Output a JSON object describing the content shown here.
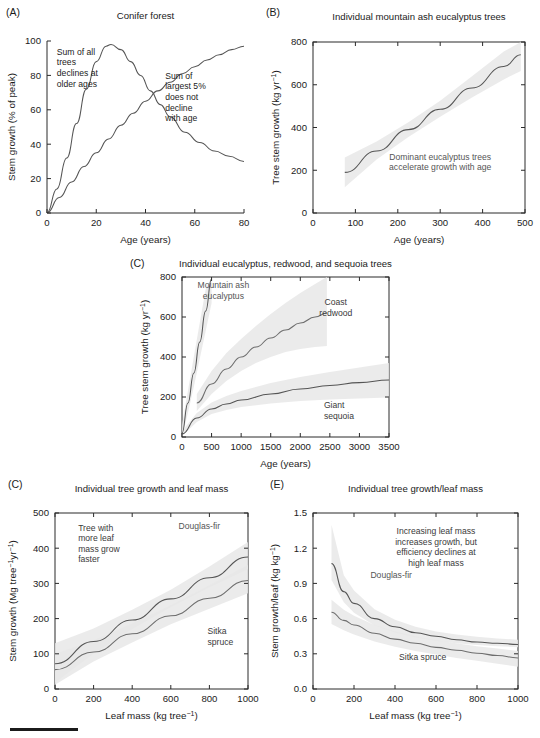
{
  "figure": {
    "caption_rule": true,
    "background": "#ffffff",
    "curve_color_dark": "#555555",
    "curve_color_mid": "#6e6e6e",
    "band_color": "#e8e8e8"
  },
  "panels": [
    {
      "id": "A",
      "label": "(A)",
      "title": "Conifer forest",
      "xlabel": "Age (years)",
      "ylabel": "Stem growth (% of peak)",
      "annotations": [
        "Sum of all trees declines at older ages",
        "Sum of largest 5% does not decline with age"
      ],
      "chart_data": {
        "type": "line",
        "title": "Conifer forest",
        "xlabel": "Age (years)",
        "ylabel": "Stem growth (% of peak)",
        "xlim": [
          0,
          80
        ],
        "ylim": [
          0,
          100
        ],
        "xticks": [
          0,
          20,
          40,
          60,
          80
        ],
        "yticks": [
          0,
          20,
          40,
          60,
          80,
          100
        ],
        "grid": false,
        "legend": "none",
        "series": [
          {
            "name": "Sum of all trees",
            "x": [
              0,
              4,
              8,
              12,
              16,
              20,
              24,
              26,
              30,
              34,
              38,
              42,
              46,
              50,
              56,
              62,
              68,
              74,
              80
            ],
            "y": [
              0,
              14,
              32,
              52,
              72,
              88,
              97,
              98,
              95,
              88,
              80,
              71,
              63,
              56,
              47,
              41,
              36,
              33,
              30
            ]
          },
          {
            "name": "Sum of largest 5%",
            "x": [
              0,
              5,
              10,
              15,
              20,
              25,
              30,
              35,
              40,
              45,
              50,
              55,
              60,
              65,
              70,
              75,
              80
            ],
            "y": [
              0,
              9,
              18,
              27,
              35,
              43,
              51,
              58,
              65,
              71,
              76,
              81,
              85,
              89,
              92,
              95,
              97
            ]
          }
        ],
        "annotations": [
          {
            "text": "Sum of all trees declines at older ages",
            "x": 4,
            "y": 92
          },
          {
            "text": "Sum of largest 5% does not decline with age",
            "x": 48,
            "y": 78
          }
        ]
      }
    },
    {
      "id": "B",
      "label": "(B)",
      "title": "Individual mountain ash eucalyptus trees",
      "xlabel": "Age (years)",
      "ylabel": "Tree stem growth (kg yr⁻¹)",
      "annotations": [
        "Dominant eucalyptus trees accelerate growth with age"
      ],
      "chart_data": {
        "type": "line",
        "title": "Individual mountain ash eucalyptus trees",
        "xlabel": "Age (years)",
        "ylabel": "Tree stem growth (kg yr-1)",
        "xlim": [
          0,
          500
        ],
        "ylim": [
          0,
          800
        ],
        "xticks": [
          0,
          100,
          200,
          300,
          400,
          500
        ],
        "yticks": [
          0,
          200,
          400,
          600,
          800
        ],
        "grid": false,
        "legend": "none",
        "series": [
          {
            "name": "Mountain ash eucalyptus",
            "x": [
              75,
              150,
              225,
              300,
              375,
              450,
              490
            ],
            "y": [
              190,
              290,
              390,
              485,
              585,
              685,
              740
            ],
            "band_lower": [
              120,
              250,
              355,
              450,
              540,
              625,
              665
            ],
            "band_upper": [
              260,
              335,
              425,
              525,
              640,
              755,
              800
            ]
          }
        ],
        "annotations": [
          {
            "text": "Dominant eucalyptus trees accelerate growth with age",
            "x": 300,
            "y": 250
          }
        ]
      }
    },
    {
      "id": "C",
      "label": "(C)",
      "title": "Individual eucalyptus, redwood, and sequoia trees",
      "xlabel": "Age (years)",
      "ylabel": "Tree stem growth (kg yr⁻¹)",
      "annotations": [
        "Mountain ash eucalyptus",
        "Coast redwood",
        "Giant sequoia"
      ],
      "chart_data": {
        "type": "line",
        "title": "Individual eucalyptus, redwood, and sequoia trees",
        "xlabel": "Age (years)",
        "ylabel": "Tree stem growth (kg yr-1)",
        "xlim": [
          0,
          3500
        ],
        "ylim": [
          0,
          800
        ],
        "xticks": [
          0,
          500,
          1000,
          1500,
          2000,
          2500,
          3000,
          3500
        ],
        "yticks": [
          0,
          200,
          400,
          600,
          800
        ],
        "grid": false,
        "legend": "none",
        "series": [
          {
            "name": "Mountain ash eucalyptus",
            "x": [
              0,
              100,
              200,
              300,
              400,
              500
            ],
            "y": [
              20,
              170,
              320,
              475,
              630,
              790
            ],
            "band_lower": [
              0,
              120,
              250,
              390,
              530,
              670
            ],
            "band_upper": [
              60,
              230,
              400,
              570,
              740,
              800
            ]
          },
          {
            "name": "Coast redwood",
            "x": [
              250,
              500,
              750,
              1000,
              1250,
              1500,
              1750,
              2000,
              2250,
              2450
            ],
            "y": [
              170,
              265,
              340,
              400,
              450,
              495,
              535,
              570,
              600,
              620
            ],
            "band_lower": [
              130,
              215,
              280,
              330,
              370,
              400,
              425,
              440,
              450,
              455
            ],
            "band_upper": [
              215,
              330,
              420,
              490,
              555,
              615,
              670,
              720,
              765,
              800
            ]
          },
          {
            "name": "Giant sequoia",
            "x": [
              0,
              250,
              500,
              750,
              1000,
              1500,
              2000,
              2500,
              3000,
              3500
            ],
            "y": [
              15,
              95,
              140,
              165,
              185,
              215,
              240,
              258,
              272,
              285
            ],
            "band_lower": [
              5,
              75,
              115,
              135,
              150,
              168,
              180,
              188,
              193,
              197
            ],
            "band_upper": [
              30,
              120,
              172,
              205,
              230,
              270,
              300,
              325,
              348,
              370
            ]
          }
        ],
        "annotations": [
          {
            "text": "Mountain ash eucalyptus",
            "x": 700,
            "y": 745
          },
          {
            "text": "Coast redwood",
            "x": 2600,
            "y": 660
          },
          {
            "text": "Giant sequoia",
            "x": 2400,
            "y": 145
          }
        ]
      }
    },
    {
      "id": "D",
      "label": "(C)",
      "title": "Individual tree growth and leaf mass",
      "xlabel": "Leaf mass (kg tree⁻¹)",
      "ylabel": "Stem growth (Mg tree⁻¹ yr⁻¹)",
      "annotations": [
        "Tree with more leaf mass grow faster",
        "Douglas-fir",
        "Sitka spruce"
      ],
      "chart_data": {
        "type": "line",
        "title": "Individual tree growth and leaf mass",
        "xlabel": "Leaf mass (kg tree-1)",
        "ylabel": "Stem growth (Mg tree-1 yr-1)",
        "xlim": [
          0,
          1000
        ],
        "ylim": [
          0,
          500
        ],
        "xticks": [
          0,
          200,
          400,
          600,
          800,
          1000
        ],
        "yticks": [
          0,
          100,
          200,
          300,
          400,
          500
        ],
        "grid": false,
        "legend": "none",
        "series": [
          {
            "name": "Douglas-fir",
            "x": [
              0,
              200,
              400,
              600,
              800,
              1000
            ],
            "y": [
              72,
              135,
              196,
              256,
              316,
              375
            ],
            "band_lower": [
              18,
              100,
              170,
              232,
              288,
              340
            ],
            "band_upper": [
              130,
              172,
              225,
              282,
              348,
              418
            ]
          },
          {
            "name": "Sitka spruce",
            "x": [
              0,
              200,
              400,
              600,
              800,
              1000
            ],
            "y": [
              55,
              105,
              157,
              208,
              258,
              308
            ],
            "band_lower": [
              12,
              78,
              132,
              184,
              228,
              272
            ],
            "band_upper": [
              100,
              138,
              186,
              238,
              295,
              352
            ]
          }
        ],
        "annotations": [
          {
            "text": "Tree with more leaf mass grow faster",
            "x": 120,
            "y": 450
          },
          {
            "text": "Douglas-fir",
            "x": 640,
            "y": 455
          },
          {
            "text": "Sitka spruce",
            "x": 790,
            "y": 155
          }
        ]
      }
    },
    {
      "id": "E",
      "label": "(E)",
      "title": "Individual tree growth/leaf mass",
      "xlabel": "Leaf mass (kg tree⁻¹)",
      "ylabel": "Stem growth/leaf (kg kg⁻¹)",
      "annotations": [
        "Increasing leaf mass increases growth, but efficiency declines at high leaf mass",
        "Douglas-fir",
        "Sitka spruce"
      ],
      "chart_data": {
        "type": "line",
        "title": "Individual tree growth/leaf mass",
        "xlabel": "Leaf mass (kg tree-1)",
        "ylabel": "Stem growth/leaf (kg kg-1)",
        "xlim": [
          0,
          1000
        ],
        "ylim": [
          0.0,
          1.5
        ],
        "xticks": [
          0,
          200,
          400,
          600,
          800,
          1000
        ],
        "yticks": [
          0.0,
          0.3,
          0.6,
          0.9,
          1.2,
          1.5
        ],
        "grid": false,
        "legend": "none",
        "series": [
          {
            "name": "Douglas-fir",
            "x": [
              90,
              150,
              200,
              300,
              400,
              500,
              600,
              700,
              800,
              900,
              1000
            ],
            "y": [
              1.07,
              0.83,
              0.73,
              0.6,
              0.53,
              0.48,
              0.45,
              0.42,
              0.4,
              0.39,
              0.38
            ],
            "band_lower": [
              0.93,
              0.74,
              0.65,
              0.54,
              0.48,
              0.44,
              0.41,
              0.39,
              0.375,
              0.365,
              0.355
            ],
            "band_upper": [
              1.4,
              0.97,
              0.84,
              0.68,
              0.59,
              0.53,
              0.49,
              0.465,
              0.445,
              0.43,
              0.42
            ]
          },
          {
            "name": "Sitka spruce",
            "x": [
              90,
              150,
              200,
              300,
              400,
              500,
              600,
              700,
              800,
              900,
              1000
            ],
            "y": [
              0.655,
              0.585,
              0.545,
              0.475,
              0.425,
              0.39,
              0.355,
              0.33,
              0.305,
              0.285,
              0.265
            ],
            "band_lower": [
              0.555,
              0.5,
              0.465,
              0.405,
              0.36,
              0.325,
              0.295,
              0.265,
              0.24,
              0.215,
              0.19
            ],
            "band_upper": [
              0.76,
              0.675,
              0.625,
              0.545,
              0.49,
              0.45,
              0.415,
              0.39,
              0.365,
              0.345,
              0.325
            ]
          }
        ],
        "annotations": [
          {
            "text": "Increasing leaf mass increases growth, but efficiency declines at high leaf mass",
            "x": 600,
            "y": 1.32
          },
          {
            "text": "Douglas-fir",
            "x": 280,
            "y": 0.95
          },
          {
            "text": "Sitka spruce",
            "x": 420,
            "y": 0.25
          }
        ]
      }
    }
  ]
}
